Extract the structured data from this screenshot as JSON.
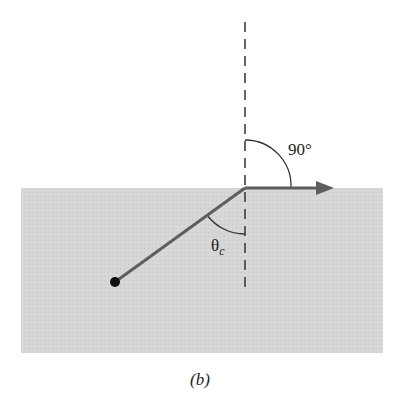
{
  "figure": {
    "caption": "(b)",
    "caption_letter": "b",
    "colors": {
      "background": "#ffffff",
      "medium": "#d6d6d6",
      "ray": "#5e5e5e",
      "lines": "#333333",
      "source": "#111111"
    }
  },
  "labels": {
    "right_angle": "90°",
    "critical_angle_symbol": "θ",
    "critical_angle_subscript": "c"
  },
  "elements": {
    "medium": "Gray region representing the denser medium",
    "normal": "Dashed vertical normal line at the interface",
    "incident_ray": "Ray from point source to the interface",
    "refracted_ray": "Refracted ray along the interface with arrowhead",
    "source": "Black dot point source"
  }
}
